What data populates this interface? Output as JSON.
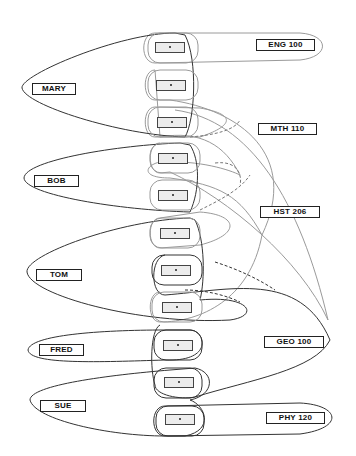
{
  "diagram": {
    "type": "enrollment-relationship-diagram",
    "students": [
      {
        "name": "MARY",
        "slots": [
          0,
          1,
          2
        ]
      },
      {
        "name": "BOB",
        "slots": [
          3,
          4
        ]
      },
      {
        "name": "TOM",
        "slots": [
          5,
          6,
          7
        ]
      },
      {
        "name": "FRED",
        "slots": [
          8
        ]
      },
      {
        "name": "SUE",
        "slots": [
          9,
          10
        ]
      }
    ],
    "courses": [
      {
        "name": "ENG 100",
        "slots": [
          0
        ]
      },
      {
        "name": "MTH 110",
        "slots": [
          1,
          3,
          7
        ]
      },
      {
        "name": "HST 206",
        "slots": [
          2,
          4,
          5
        ]
      },
      {
        "name": "GEO 100",
        "slots": [
          6,
          8,
          9
        ]
      },
      {
        "name": "PHY 120",
        "slots": [
          10
        ]
      }
    ],
    "slot_count": 11,
    "colors": {
      "student_outline": "#333333",
      "course_outline": "#9a9a9a",
      "slot_fill": "#ececec"
    }
  }
}
